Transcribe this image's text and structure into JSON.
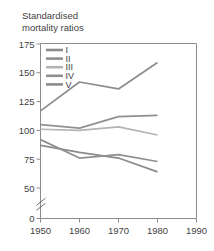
{
  "chart_data": {
    "type": "line",
    "title": "Standardised\nmortality ratios",
    "title_line1": "Standardised",
    "title_line2": "mortality ratios",
    "xlabel": "",
    "ylabel": "",
    "x": [
      1950,
      1960,
      1970,
      1980
    ],
    "xticks": [
      1950,
      1960,
      1970,
      1980,
      1990
    ],
    "xtick_labels": [
      "1950",
      "1960",
      "1970",
      "1980",
      "1990"
    ],
    "xlim": [
      1950,
      1990
    ],
    "yticks": [
      0,
      50,
      75,
      100,
      125,
      150,
      175
    ],
    "ytick_labels": [
      "0",
      "50",
      "75",
      "100",
      "125",
      "150",
      "175"
    ],
    "ylim": [
      50,
      175
    ],
    "axis_break": true,
    "axis_break_note": "y-axis broken between 0 and 50",
    "grid": false,
    "legend_position": "top-left inside plot",
    "series": [
      {
        "name": "I",
        "label": "I",
        "values": [
          87,
          81,
          76,
          64
        ],
        "color": "#8a8a8a"
      },
      {
        "name": "II",
        "label": "II",
        "values": [
          92,
          76,
          79,
          73
        ],
        "color": "#8f8f8f"
      },
      {
        "name": "III",
        "label": "III",
        "values": [
          101,
          100,
          103,
          96
        ],
        "color": "#b4b4b4"
      },
      {
        "name": "IV",
        "label": "IV",
        "values": [
          105,
          102,
          112,
          113
        ],
        "color": "#909090"
      },
      {
        "name": "V",
        "label": "V",
        "values": [
          117,
          142,
          136,
          159
        ],
        "color": "#8c8c8c"
      }
    ]
  },
  "colors": {
    "axis": "#8c8c8c",
    "text": "#3f3f3f",
    "background": "#ffffff"
  }
}
